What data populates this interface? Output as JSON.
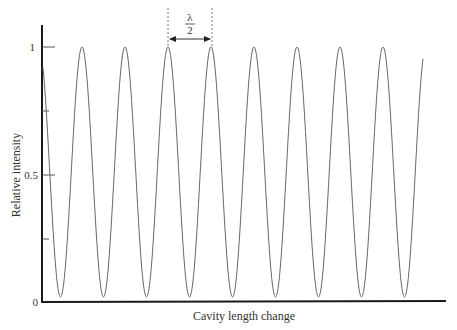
{
  "chart_data": {
    "type": "line",
    "title": "",
    "xlabel": "Cavity length change",
    "ylabel": "Relative intensity",
    "ylim": [
      0,
      1
    ],
    "yticks": [
      0,
      0.25,
      0.5,
      0.75,
      1
    ],
    "ytick_labels": [
      "0",
      "",
      "0.5",
      "",
      "1"
    ],
    "xticks": [],
    "grid": false,
    "legend": null,
    "series": [
      {
        "name": "Relative intensity",
        "function": "periodic cos^2-like fringes, period = lambda/2",
        "peak_value": 1.0,
        "trough_value": 0.02,
        "num_full_peaks": 9,
        "x_peak_positions_px": [
          82,
          125,
          169,
          212,
          255,
          298,
          341,
          384
        ],
        "period_px": 43
      }
    ],
    "annotations": [
      {
        "type": "dimension-arrow",
        "label_numerator": "λ",
        "label_denominator": "2",
        "between_peaks": [
          3,
          4
        ]
      }
    ]
  },
  "labels": {
    "x_axis": "Cavity length change",
    "y_axis": "Relative intensity",
    "y_tick_0": "0",
    "y_tick_05": "0.5",
    "y_tick_1": "1",
    "annot_num": "λ",
    "annot_den": "2"
  },
  "colors": {
    "axis": "#1a1a1a",
    "curve": "#666666",
    "text": "#333333"
  }
}
